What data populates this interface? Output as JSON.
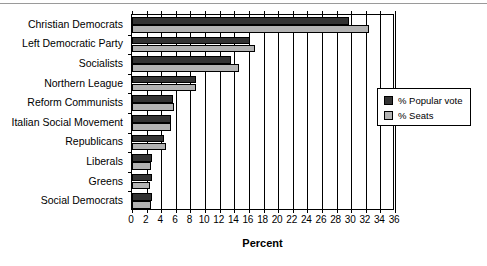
{
  "chart_data": {
    "type": "bar",
    "orientation": "horizontal",
    "title": "",
    "xlabel": "Percent",
    "ylabel": "",
    "xlim": [
      0,
      36
    ],
    "xticks": [
      0,
      2,
      4,
      6,
      8,
      10,
      12,
      14,
      16,
      18,
      20,
      22,
      24,
      26,
      28,
      30,
      32,
      34,
      36
    ],
    "grid": true,
    "legend_position": "right",
    "categories": [
      "Christian Democrats",
      "Left Democratic Party",
      "Socialists",
      "Northern League",
      "Reform Communists",
      "Italian Social Movement",
      "Republicans",
      "Liberals",
      "Greens",
      "Social Democrats"
    ],
    "series": [
      {
        "name": "% Popular vote",
        "color": "#333333",
        "values": [
          29.7,
          16.1,
          13.6,
          8.7,
          5.6,
          5.4,
          4.4,
          2.8,
          2.8,
          2.7
        ]
      },
      {
        "name": "% Seats",
        "color": "#b3b3b3",
        "values": [
          32.4,
          16.9,
          14.6,
          8.8,
          5.7,
          5.4,
          4.7,
          2.6,
          2.5,
          2.6
        ]
      }
    ]
  },
  "legend": {
    "items": [
      {
        "label": "% Popular vote",
        "swatch": "vote"
      },
      {
        "label": "% Seats",
        "swatch": "seats"
      }
    ]
  },
  "axis": {
    "x_title": "Percent"
  }
}
